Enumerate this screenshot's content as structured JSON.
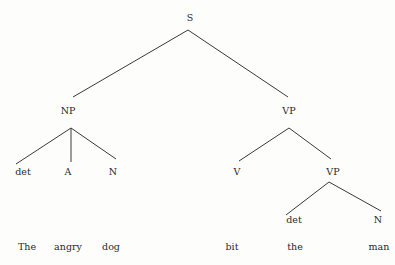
{
  "diagram": {
    "type": "syntax-tree",
    "sentence": "The angry dog bit the man",
    "nodes": {
      "S": {
        "label": "S",
        "x": 190,
        "y": 18
      },
      "NP": {
        "label": "NP",
        "x": 68,
        "y": 111
      },
      "VP1": {
        "label": "VP",
        "x": 289,
        "y": 111
      },
      "det1": {
        "label": "det",
        "x": 23,
        "y": 172
      },
      "A": {
        "label": "A",
        "x": 68,
        "y": 172
      },
      "N1": {
        "label": "N",
        "x": 113,
        "y": 172
      },
      "V": {
        "label": "V",
        "x": 237,
        "y": 172
      },
      "VP2": {
        "label": "VP",
        "x": 333,
        "y": 172
      },
      "det2": {
        "label": "det",
        "x": 294,
        "y": 220
      },
      "N2": {
        "label": "N",
        "x": 378,
        "y": 220
      }
    },
    "words": [
      {
        "text": "The",
        "x": 27,
        "y": 247
      },
      {
        "text": "angry",
        "x": 68,
        "y": 247
      },
      {
        "text": "dog",
        "x": 111,
        "y": 247
      },
      {
        "text": "bit",
        "x": 232,
        "y": 247
      },
      {
        "text": "the",
        "x": 295,
        "y": 247
      },
      {
        "text": "man",
        "x": 379,
        "y": 247
      }
    ],
    "edges": [
      {
        "from": "S",
        "to": "NP",
        "x1": 188,
        "y1": 30,
        "x2": 73,
        "y2": 97
      },
      {
        "from": "S",
        "to": "VP1",
        "x1": 188,
        "y1": 30,
        "x2": 288,
        "y2": 97
      },
      {
        "from": "NP",
        "to": "det1",
        "x1": 71,
        "y1": 128,
        "x2": 16,
        "y2": 164
      },
      {
        "from": "NP",
        "to": "A",
        "x1": 71,
        "y1": 128,
        "x2": 71,
        "y2": 162
      },
      {
        "from": "NP",
        "to": "N1",
        "x1": 71,
        "y1": 128,
        "x2": 116,
        "y2": 159
      },
      {
        "from": "VP1",
        "to": "V",
        "x1": 289,
        "y1": 128,
        "x2": 239,
        "y2": 161
      },
      {
        "from": "VP1",
        "to": "VP2",
        "x1": 289,
        "y1": 128,
        "x2": 331,
        "y2": 159
      },
      {
        "from": "VP2",
        "to": "det2",
        "x1": 329,
        "y1": 182,
        "x2": 286,
        "y2": 215
      },
      {
        "from": "VP2",
        "to": "N2",
        "x1": 329,
        "y1": 182,
        "x2": 381,
        "y2": 211
      }
    ],
    "colors": {
      "line": "#3a3a3a",
      "text": "#2a2a2a",
      "background": "#fdfdfc"
    }
  }
}
